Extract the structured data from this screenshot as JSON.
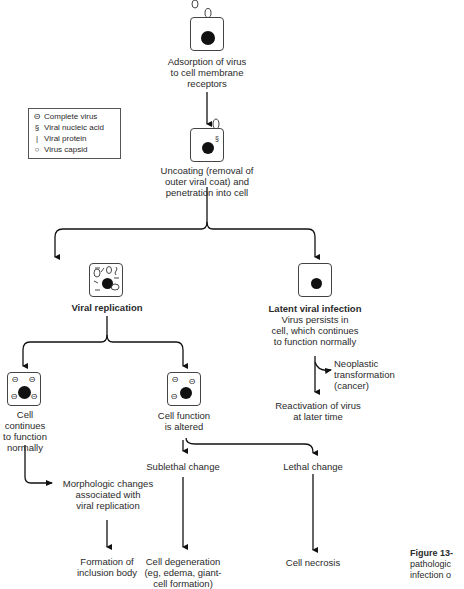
{
  "legend": {
    "items": [
      {
        "icon": "complete-virus-icon",
        "glyph": "Θ",
        "label": "Complete virus"
      },
      {
        "icon": "viral-nucleic-acid-icon",
        "glyph": "§",
        "label": "Viral nucleic acid"
      },
      {
        "icon": "viral-protein-icon",
        "glyph": "|",
        "label": "Viral protein"
      },
      {
        "icon": "virus-capsid-icon",
        "glyph": "○",
        "label": "Virus capsid"
      }
    ]
  },
  "nodes": {
    "adsorption": "Adsorption of virus\nto cell membrane\nreceptors",
    "uncoating": "Uncoating (removal of\nouter viral coat) and\npenetration into cell",
    "viral_replication": "Viral replication",
    "latent_title": "Latent viral infection",
    "latent_desc": "Virus persists in\ncell, which continues\nto function normally",
    "neoplastic": "Neoplastic\ntransformation\n(cancer)",
    "reactivation": "Reactivation of virus\nat later time",
    "cell_continues": "Cell\ncontinues\nto function\nnormally",
    "cell_altered": "Cell function\nis altered",
    "morphologic": "Morphologic changes\nassociated with\nviral replication",
    "inclusion_body": "Formation of\ninclusion body",
    "sublethal": "Sublethal change",
    "lethal": "Lethal change",
    "degeneration": "Cell degeneration\n(eg, edema, giant-\ncell formation)",
    "necrosis": "Cell necrosis"
  },
  "caption": {
    "label": "Figure 13-",
    "line2": "pathologic",
    "line3": "infection o"
  }
}
